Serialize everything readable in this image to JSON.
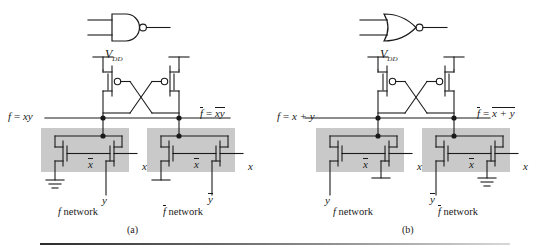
{
  "figure": {
    "background": "#ffffff",
    "wire_color": "#1a1a1a",
    "network_box_fill": "#c9c9c9",
    "rule_color": "#2b2b2b"
  },
  "panels": [
    {
      "id": "a",
      "caption": "(a)",
      "gate_symbol": "NAND",
      "gate_symbol_name": "nand-gate-symbol",
      "supply_label": "V",
      "supply_sub": "DD",
      "left_output_label": "f = xy",
      "left_output_parts": {
        "f": "f",
        "eq": "=",
        "expr": "xy",
        "f_overline": false,
        "expr_overline": false
      },
      "right_output_parts": {
        "f": "f",
        "eq": "=",
        "expr": "xy",
        "f_overline": true,
        "expr_overline": true
      },
      "networks": [
        {
          "name": "f network",
          "name_overline": false,
          "transistors": [
            {
              "gate_label": "x",
              "gate_overline": true
            },
            {
              "gate_label": "x",
              "gate_overline": false
            }
          ],
          "terminals": [
            {
              "type": "ground",
              "label": "",
              "position": "left"
            },
            {
              "type": "input",
              "label": "y",
              "overline": false,
              "position": "bottom-right"
            }
          ],
          "right_input_label": "x",
          "right_input_overline": false
        },
        {
          "name": "f network",
          "name_overline": true,
          "transistors": [
            {
              "gate_label": "x",
              "gate_overline": true
            },
            {
              "gate_label": "x",
              "gate_overline": false
            }
          ],
          "terminals": [
            {
              "type": "ground",
              "label": "",
              "position": "left"
            },
            {
              "type": "input",
              "label": "y",
              "overline": true,
              "position": "bottom-right"
            }
          ],
          "right_input_label": "x",
          "right_input_overline": false
        }
      ]
    },
    {
      "id": "b",
      "caption": "(b)",
      "gate_symbol": "NOR",
      "gate_symbol_name": "nor-gate-symbol",
      "supply_label": "V",
      "supply_sub": "DD",
      "left_output_label": "f = x + y",
      "left_output_parts": {
        "f": "f",
        "eq": "=",
        "expr": "x + y",
        "f_overline": false,
        "expr_overline": false
      },
      "right_output_parts": {
        "f": "f",
        "eq": "=",
        "expr": "x + y",
        "f_overline": true,
        "expr_overline": true
      },
      "networks": [
        {
          "name": "f network",
          "name_overline": false,
          "transistors": [
            {
              "gate_label": "x",
              "gate_overline": true
            },
            {
              "gate_label": "x",
              "gate_overline": false
            }
          ],
          "terminals": [
            {
              "type": "input",
              "label": "y",
              "overline": false,
              "position": "bottom-left"
            },
            {
              "type": "ground",
              "label": "",
              "position": "middle"
            }
          ],
          "right_input_label": "x",
          "right_input_overline": false
        },
        {
          "name": "f network",
          "name_overline": true,
          "transistors": [
            {
              "gate_label": "x",
              "gate_overline": true
            },
            {
              "gate_label": "x",
              "gate_overline": false
            }
          ],
          "terminals": [
            {
              "type": "input",
              "label": "y",
              "overline": true,
              "position": "bottom-left"
            },
            {
              "type": "ground",
              "label": "",
              "position": "middle"
            }
          ],
          "right_input_label": "x",
          "right_input_overline": false
        }
      ]
    }
  ]
}
